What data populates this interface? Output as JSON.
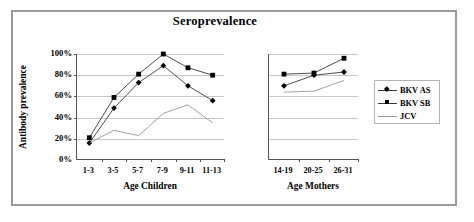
{
  "chart_data": {
    "type": "line",
    "title": "Seroprevalence",
    "ylabel": "Antibody prevalence",
    "ylim": [
      0,
      100
    ],
    "yticks": [
      "0%",
      "20%",
      "40%",
      "60%",
      "80%",
      "100%"
    ],
    "ytick_values": [
      0,
      20,
      40,
      60,
      80,
      100
    ],
    "grid": true,
    "legend_position": "right",
    "legend": [
      "BKV AS",
      "BKV SB",
      "JCV"
    ],
    "panels": [
      {
        "name": "children",
        "xlabel": "Age Children",
        "categories": [
          "1-3",
          "3-5",
          "5-7",
          "7-9",
          "9-11",
          "11-13"
        ],
        "series": [
          {
            "name": "BKV AS",
            "marker": "diamond",
            "values": [
              16,
              49,
              73,
              89,
              70,
              56
            ]
          },
          {
            "name": "BKV SB",
            "marker": "square",
            "values": [
              21,
              59,
              81,
              100,
              87,
              80
            ]
          },
          {
            "name": "JCV",
            "marker": "none",
            "values": [
              16,
              28,
              23,
              44,
              52,
              35
            ]
          }
        ]
      },
      {
        "name": "mothers",
        "xlabel": "Age Mothers",
        "categories": [
          "14-19",
          "20-25",
          "26-31"
        ],
        "series": [
          {
            "name": "BKV AS",
            "marker": "diamond",
            "values": [
              70,
              80,
              83
            ]
          },
          {
            "name": "BKV SB",
            "marker": "square",
            "values": [
              81,
              82,
              96
            ]
          },
          {
            "name": "JCV",
            "marker": "none",
            "values": [
              64,
              65,
              75
            ]
          }
        ]
      }
    ]
  },
  "colors": {
    "series_line": "#3a3a3a",
    "jcv_line": "#8c8c8c",
    "marker": "#000000",
    "grid": "#c8c8c8",
    "axis": "#555555",
    "frame": "#9a9a9a",
    "text": "#000000"
  }
}
